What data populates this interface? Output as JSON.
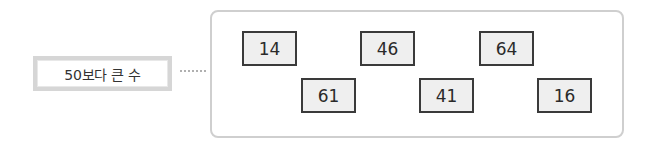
{
  "label": {
    "text": "50보다 큰 수"
  },
  "numbers": [
    {
      "value": "14",
      "x": 242,
      "y": 31
    },
    {
      "value": "46",
      "x": 360,
      "y": 31
    },
    {
      "value": "64",
      "x": 479,
      "y": 31
    },
    {
      "value": "61",
      "x": 301,
      "y": 78
    },
    {
      "value": "41",
      "x": 419,
      "y": 78
    },
    {
      "value": "16",
      "x": 537,
      "y": 78
    }
  ],
  "colors": {
    "number_box_fill": "#efefef",
    "number_box_border": "#3a3a3a",
    "container_border": "#cfcfcf",
    "label_border": "#d6d6d6"
  }
}
